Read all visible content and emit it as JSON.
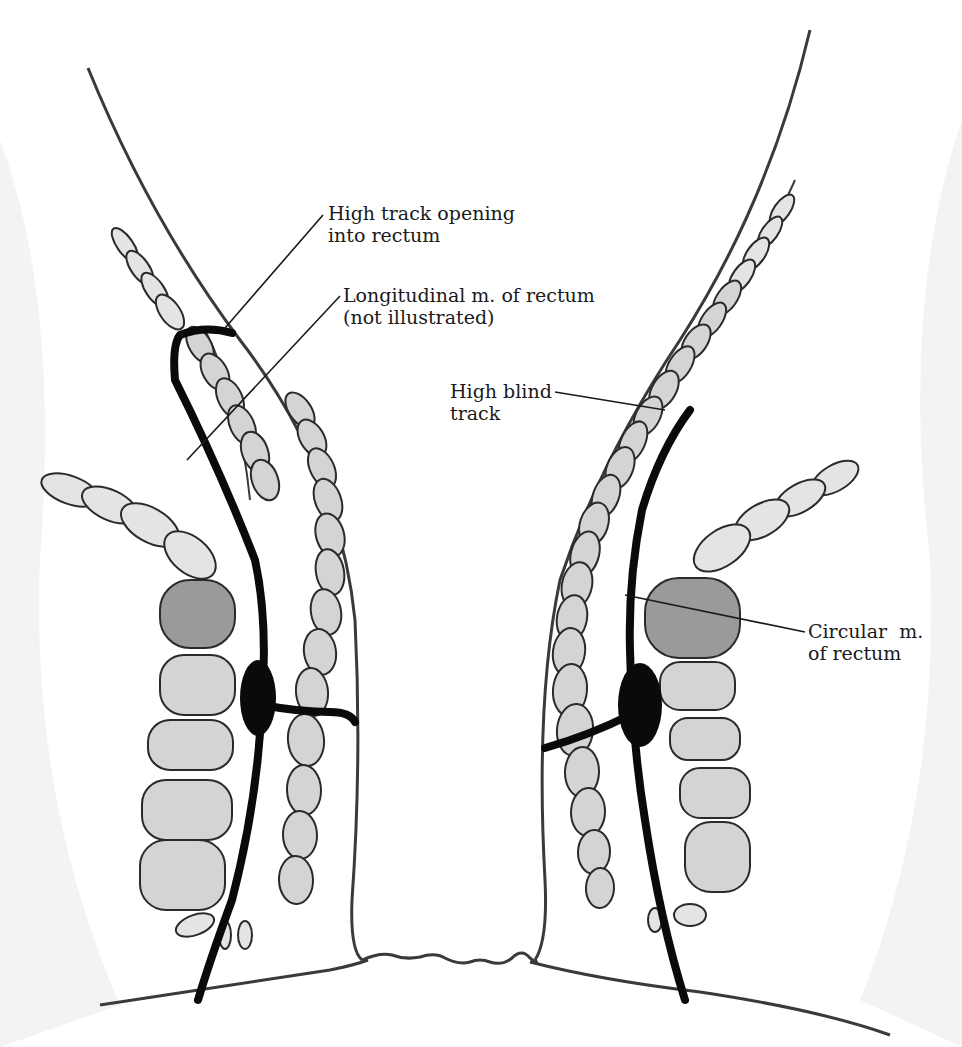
{
  "figure": {
    "type": "anatomical-illustration",
    "background_color": "#ffffff",
    "track_color": "#0a0a0a",
    "muscle_fill": "#d4d4d4",
    "muscle_dark_fill": "#9a9a9a"
  },
  "labels": {
    "high_track_opening": {
      "line1": "High track opening",
      "line2": "into rectum"
    },
    "longitudinal_muscle": {
      "line1": "Longitudinal m. of rectum",
      "line2": "(not illustrated)"
    },
    "high_blind_track": {
      "line1": "High blind",
      "line2": "track"
    },
    "circular_muscle": {
      "line1": "Circular  m.",
      "line2": "of rectum"
    }
  }
}
